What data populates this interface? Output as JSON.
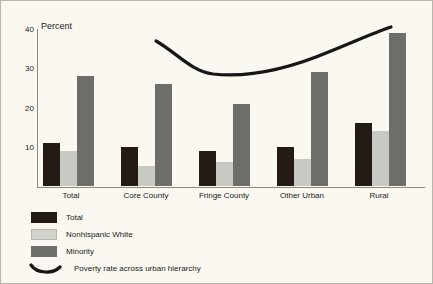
{
  "chart_data": {
    "type": "bar",
    "title": "",
    "subtitle": "",
    "xlabel": "",
    "ylabel": "Percent",
    "ylim": [
      0,
      40
    ],
    "yticks": [
      0,
      10,
      20,
      30,
      40
    ],
    "ytick_labels": [
      "",
      "10",
      "20",
      "30",
      "40"
    ],
    "grid": false,
    "legend_position": "below-left",
    "categories": [
      "Total",
      "Core County",
      "Fringe County",
      "Other Urban",
      "Rural"
    ],
    "series": [
      {
        "name": "Total",
        "color": "#241a16",
        "values": [
          11,
          10,
          9,
          10,
          16
        ]
      },
      {
        "name": "Nonhispanic White",
        "color": "#c9c9c4",
        "values": [
          9,
          5,
          6,
          7,
          14
        ]
      },
      {
        "name": "Minority",
        "color": "#6d6d6a",
        "values": [
          28,
          26,
          21,
          29,
          39
        ]
      }
    ],
    "annotations": [
      {
        "name": "poverty-rate-curve",
        "label": "Poverty rate across urban hierarchy",
        "type": "curve",
        "color": "#161616",
        "description": "U-shaped trend line spanning Core County through Rural, starting near 35, dipping to about 28 at Fringe County, rising to about 40 at Rural"
      }
    ]
  },
  "axis": {
    "y_title": "Percent",
    "ticks": [
      {
        "value": 40,
        "label": "40"
      },
      {
        "value": 30,
        "label": "30"
      },
      {
        "value": 20,
        "label": "20"
      },
      {
        "value": 10,
        "label": "10"
      }
    ]
  },
  "categories": [
    {
      "label": "Total"
    },
    {
      "label": "Core County"
    },
    {
      "label": "Fringe County"
    },
    {
      "label": "Other Urban"
    },
    {
      "label": "Rural"
    }
  ],
  "legend": {
    "items": [
      {
        "label": "Total",
        "swatch": "total"
      },
      {
        "label": "Nonhispanic White",
        "swatch": "white"
      },
      {
        "label": "Minority",
        "swatch": "minority"
      },
      {
        "label": "Poverty rate across urban hierarchy",
        "swatch": "curve"
      }
    ]
  }
}
